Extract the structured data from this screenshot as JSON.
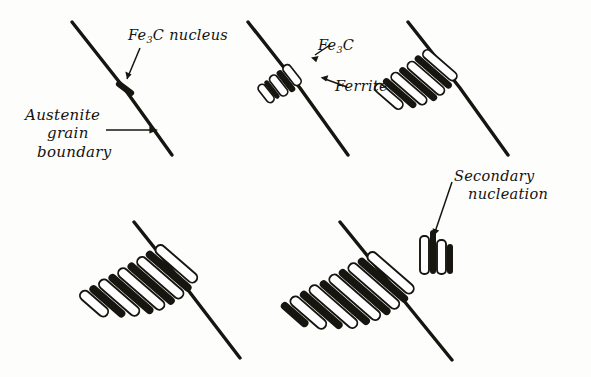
{
  "figure": {
    "ink_color": "#17150f",
    "background_color": "#fdfdfb"
  },
  "labels": {
    "fe3c_nucleus": {
      "pre": "Fe",
      "sub": "3",
      "post": "C nucleus"
    },
    "austenite_boundary": {
      "line1": "Austenite",
      "line2": "grain",
      "line3": "boundary"
    },
    "fe3c": {
      "pre": "Fe",
      "sub": "3",
      "post": "C"
    },
    "ferrite": {
      "text": "Ferrite"
    },
    "secondary_nucleation": {
      "line1": "Secondary",
      "line2": "nucleation"
    }
  },
  "panels": [
    {
      "id": "panel-1",
      "stage": 1,
      "caption": "Fe3C nucleus on austenite grain boundary",
      "boundary": {
        "x1": 72,
        "y1": 22,
        "x2": 172,
        "y2": 155
      },
      "lamellae_count": 0,
      "has_nucleus": true,
      "secondary_nucleation": false
    },
    {
      "id": "panel-2",
      "stage": 2,
      "caption": "Fe3C and ferrite lamellae begin to form",
      "boundary": {
        "x1": 248,
        "y1": 22,
        "x2": 348,
        "y2": 155
      },
      "lamellae_count": 3,
      "has_nucleus": false,
      "secondary_nucleation": false
    },
    {
      "id": "panel-3",
      "stage": 3,
      "caption": "Pearlite colony grows along and away from boundary",
      "boundary": {
        "x1": 408,
        "y1": 22,
        "x2": 508,
        "y2": 155
      },
      "lamellae_count": 5,
      "has_nucleus": false,
      "secondary_nucleation": false
    },
    {
      "id": "panel-4",
      "stage": 4,
      "caption": "Colony enlarges into the austenite grain",
      "boundary": {
        "x1": 134,
        "y1": 222,
        "x2": 240,
        "y2": 358
      },
      "lamellae_count": 6,
      "has_nucleus": false,
      "secondary_nucleation": false
    },
    {
      "id": "panel-5",
      "stage": 5,
      "caption": "Secondary nucleation of new lamellae",
      "boundary": {
        "x1": 340,
        "y1": 222,
        "x2": 452,
        "y2": 360
      },
      "lamellae_count": 7,
      "has_nucleus": false,
      "secondary_nucleation": true
    }
  ]
}
